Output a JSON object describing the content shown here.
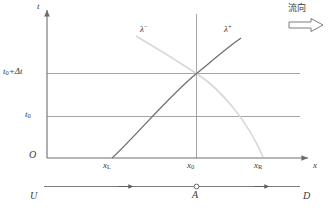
{
  "figure": {
    "type": "characteristics-diagram",
    "axes": {
      "t_axis_label": "t",
      "x_axis_label": "x",
      "origin_label": "O",
      "t_ticks": [
        {
          "id": "t0_plus_dt",
          "base": "t",
          "sub": "0",
          "extra": "+Δt",
          "display": "t₀+Δt"
        },
        {
          "id": "t0",
          "base": "t",
          "sub": "0",
          "extra": "",
          "display": "t₀"
        }
      ],
      "x_ticks": [
        {
          "id": "xL",
          "base": "x",
          "sub": "L",
          "display": "xʟ"
        },
        {
          "id": "x0",
          "base": "x",
          "sub": "0",
          "display": "x₀"
        },
        {
          "id": "xR",
          "base": "x",
          "sub": "R",
          "display": "xʀ"
        }
      ]
    },
    "curves": [
      {
        "id": "lambda-minus",
        "base": "λ",
        "sup": "−",
        "display": "λ⁻",
        "color": "#d8d8d8",
        "description": "negative characteristic, descending from upper-left to x_R"
      },
      {
        "id": "lambda-plus",
        "base": "λ",
        "sup": "+",
        "display": "λ⁺",
        "color": "#6e6e6e",
        "description": "positive characteristic, ascending from x_L to upper-right"
      }
    ],
    "flow_annotation": {
      "text": "流向",
      "arrow_direction": "right"
    },
    "bottom_line": {
      "left_label": "U",
      "right_label": "D",
      "point_label": "A",
      "arrow_direction": "right",
      "arrow_count": 2
    },
    "colors": {
      "axis": "#6e6e6e",
      "grid": "#8f8f8f",
      "text": "#3a3a3a",
      "lambda_plus": "#6e6e6e",
      "lambda_minus": "#d8d8d8",
      "background": "#ffffff"
    }
  }
}
